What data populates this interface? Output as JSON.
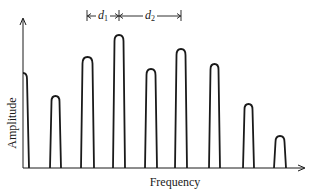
{
  "chart_data": {
    "type": "line",
    "title": "",
    "xlabel": "Frequency",
    "ylabel": "Amplitude",
    "grid": false,
    "annotations": [
      {
        "label": "d1",
        "from_peak": 3,
        "to_peak": 4
      },
      {
        "label": "d2",
        "from_peak": 4,
        "to_peak": 6
      }
    ],
    "peaks": [
      {
        "x": [
          23,
          29
        ],
        "top": 73
      },
      {
        "x": [
          50,
          61
        ],
        "top": 96
      },
      {
        "x": [
          81,
          94
        ],
        "top": 57
      },
      {
        "x": [
          113,
          125
        ],
        "top": 35
      },
      {
        "x": [
          145,
          157
        ],
        "top": 69
      },
      {
        "x": [
          175,
          187
        ],
        "top": 49
      },
      {
        "x": [
          209,
          220
        ],
        "top": 64
      },
      {
        "x": [
          243,
          254
        ],
        "top": 104
      },
      {
        "x": [
          274,
          286
        ],
        "top": 136
      }
    ],
    "relative_amplitudes": [
      0.65,
      0.5,
      0.75,
      0.9,
      0.67,
      0.8,
      0.7,
      0.43,
      0.22
    ]
  },
  "labels": {
    "xlabel": "Frequency",
    "ylabel": "Amplitude",
    "d1_main": "d",
    "d1_sub": "1",
    "d2_main": "d",
    "d2_sub": "2"
  }
}
